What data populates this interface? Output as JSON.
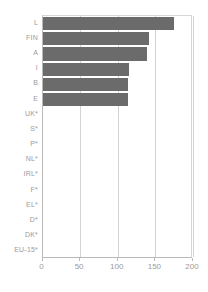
{
  "chart_data": {
    "type": "bar",
    "orientation": "horizontal",
    "title": "",
    "subtitle": "",
    "xlabel": "",
    "ylabel": "",
    "xlim": [
      0,
      200
    ],
    "xticks": [
      0,
      50,
      100,
      150,
      200
    ],
    "grid": "vertical",
    "legend": "none",
    "bar_color": "#6b6b6b",
    "axis_color": "#b9b9b9",
    "gridline_color": "#d3d3d3",
    "label_color": "#9a9a9a",
    "categories": [
      "L",
      "FIN",
      "A",
      "I",
      "B",
      "E",
      "UK*",
      "S*",
      "P*",
      "NL*",
      "IRL*",
      "F*",
      "EL*",
      "D*",
      "DK*",
      "EU-15*"
    ],
    "values": [
      175,
      141,
      139,
      115,
      114,
      114,
      0,
      0,
      0,
      0,
      0,
      0,
      0,
      0,
      0,
      0
    ],
    "note": "Categories marked with * have no bar plotted"
  }
}
